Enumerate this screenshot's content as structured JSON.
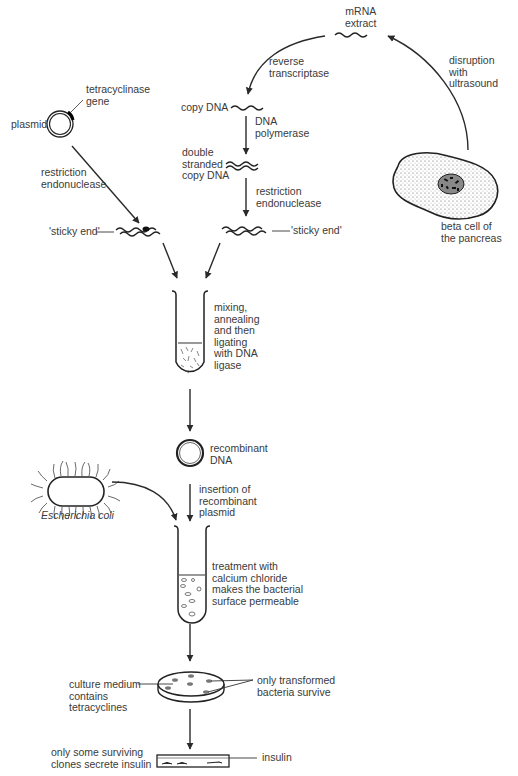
{
  "diagram": {
    "labels": {
      "mrna_extract": "mRNA\nextract",
      "reverse_transcriptase": "reverse\ntranscriptase",
      "disruption": "disruption\nwith\nultrasound",
      "tetracyclinase_gene": "tetracyclinase\ngene",
      "plasmid": "plasmid",
      "copy_dna": "copy DNA",
      "dna_polymerase": "DNA\npolymerase",
      "double_stranded": "double\nstranded\ncopy DNA",
      "restriction_left": "restriction\nendonuclease",
      "restriction_right": "restriction\nendonuclease",
      "beta_cell": "beta cell of\nthe pancreas",
      "sticky_end_left": "'sticky end'",
      "sticky_end_right": "'sticky end'",
      "mixing": "mixing,\nannealing\nand then\nligating\nwith DNA\nligase",
      "recombinant_dna": "recombinant\nDNA",
      "insertion": "insertion of\nrecombinant\nplasmid",
      "ecoli": "Escherichia coli",
      "treatment": "treatment with\ncalcium chloride\nmakes the bacterial\nsurface permeable",
      "culture_medium": "culture medium\ncontains\ntetracyclines",
      "only_transformed": "only transformed\nbacteria survive",
      "only_some": "only some surviving\nclones secrete insulin",
      "insulin": "insulin"
    },
    "nodes": [
      {
        "id": "beta-cell",
        "label": "beta cell of the pancreas"
      },
      {
        "id": "mrna",
        "label": "mRNA extract"
      },
      {
        "id": "copy-dna",
        "label": "copy DNA"
      },
      {
        "id": "ds-copy-dna",
        "label": "double stranded copy DNA"
      },
      {
        "id": "sticky-right",
        "label": "'sticky end'"
      },
      {
        "id": "plasmid",
        "label": "plasmid"
      },
      {
        "id": "sticky-left",
        "label": "'sticky end'"
      },
      {
        "id": "tube-1",
        "label": "mixing, annealing and then ligating with DNA ligase"
      },
      {
        "id": "recombinant",
        "label": "recombinant DNA"
      },
      {
        "id": "ecoli",
        "label": "Escherichia coli"
      },
      {
        "id": "tube-2",
        "label": "treatment with calcium chloride makes the bacterial surface permeable"
      },
      {
        "id": "petri",
        "label": "culture medium contains tetracyclines / only transformed bacteria survive"
      },
      {
        "id": "dish",
        "label": "only some surviving clones secrete insulin"
      }
    ],
    "edges": [
      {
        "from": "beta-cell",
        "to": "mrna",
        "label": "disruption with ultrasound"
      },
      {
        "from": "mrna",
        "to": "copy-dna",
        "label": "reverse transcriptase"
      },
      {
        "from": "copy-dna",
        "to": "ds-copy-dna",
        "label": "DNA polymerase"
      },
      {
        "from": "ds-copy-dna",
        "to": "sticky-right",
        "label": "restriction endonuclease"
      },
      {
        "from": "plasmid",
        "to": "sticky-left",
        "label": "restriction endonuclease"
      },
      {
        "from": "sticky-left",
        "to": "tube-1",
        "label": ""
      },
      {
        "from": "sticky-right",
        "to": "tube-1",
        "label": ""
      },
      {
        "from": "tube-1",
        "to": "recombinant",
        "label": ""
      },
      {
        "from": "recombinant",
        "to": "tube-2",
        "label": "insertion of recombinant plasmid"
      },
      {
        "from": "ecoli",
        "to": "tube-2",
        "label": ""
      },
      {
        "from": "tube-2",
        "to": "petri",
        "label": ""
      },
      {
        "from": "petri",
        "to": "dish",
        "label": ""
      }
    ]
  }
}
